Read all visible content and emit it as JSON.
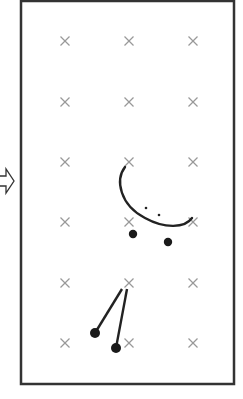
{
  "diagram": {
    "frame": {
      "x": 21,
      "y": 1,
      "width": 213,
      "height": 383,
      "stroke": "#333333"
    },
    "grid_marks": {
      "symbol": "cross",
      "color": "#999999",
      "xs": [
        65,
        129,
        193
      ],
      "ys": [
        41,
        102,
        162,
        222,
        283,
        343
      ]
    },
    "entry_arrow": {
      "direction": "right",
      "x_tip": 14,
      "y": 181,
      "style": "outline"
    },
    "arc": {
      "path": "M125,167 C115,180 120,205 145,218 C165,229 185,228 192,218",
      "color": "#222222"
    },
    "small_dots": [
      {
        "x": 146,
        "y": 208
      },
      {
        "x": 159,
        "y": 215
      }
    ],
    "large_dots": [
      {
        "x": 133,
        "y": 234
      },
      {
        "x": 168,
        "y": 242
      }
    ],
    "pendulums": [
      {
        "x1": 122,
        "y1": 289,
        "x2": 95,
        "y2": 333
      },
      {
        "x1": 127,
        "y1": 289,
        "x2": 116,
        "y2": 348
      }
    ]
  }
}
